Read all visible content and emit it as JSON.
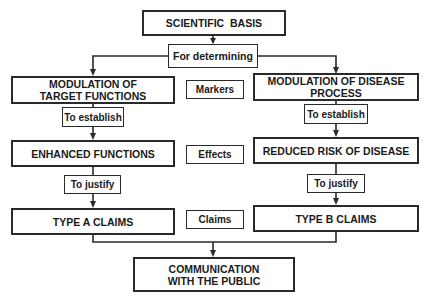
{
  "diagram": {
    "nodes": {
      "root": {
        "line1": "SCIENTIFIC  BASIS"
      },
      "determining": {
        "label": "For determining"
      },
      "left_top": {
        "line1": "MODULATION OF",
        "line2": "TARGET FUNCTIONS"
      },
      "right_top": {
        "line1": "MODULATION OF DISEASE",
        "line2": "PROCESS"
      },
      "left_mid": {
        "line1": "ENHANCED FUNCTIONS"
      },
      "right_mid": {
        "line1": "REDUCED RISK OF DISEASE"
      },
      "left_bottom": {
        "line1": "TYPE A CLAIMS"
      },
      "right_bottom": {
        "line1": "TYPE B CLAIMS"
      },
      "final": {
        "line1": "COMMUNICATION",
        "line2": "WITH THE PUBLIC"
      }
    },
    "edge_labels": {
      "left_establish": "To establish",
      "right_establish": "To establish",
      "left_justify": "To justify",
      "right_justify": "To justify"
    },
    "row_labels": {
      "markers": "Markers",
      "effects": "Effects",
      "claims": "Claims"
    },
    "colors": {
      "stroke": "#2a2a2a",
      "background": "#ffffff",
      "text": "#1a1a1a"
    }
  }
}
